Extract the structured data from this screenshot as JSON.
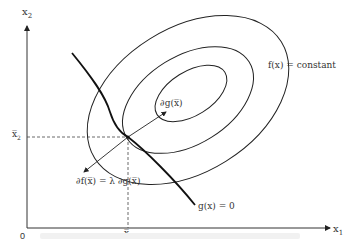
{
  "diagram": {
    "type": "constrained-optimization-level-sets",
    "axes": {
      "x_label": "x",
      "x_sub": "1",
      "y_label": "x",
      "y_sub": "2",
      "origin": "0"
    },
    "ticks": {
      "x_bar": "x̅",
      "x_bar_sub": "1",
      "y_bar": "x̅",
      "y_bar_sub": "2"
    },
    "labels": {
      "objective": "f(x) = constant",
      "constraint": "g(x) = 0",
      "grad_g": "∂g(x̅)",
      "grad_f": "∂f(x̅) = λ ∂g(x̅)"
    },
    "colors": {
      "line": "#222222",
      "text": "#333333",
      "background": "#ffffff"
    }
  }
}
